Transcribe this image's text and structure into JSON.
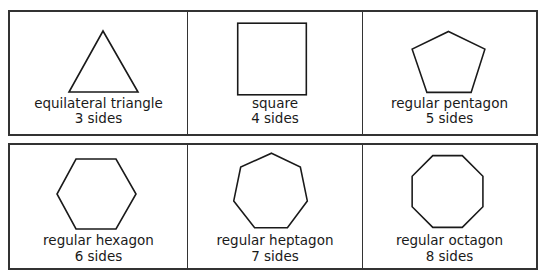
{
  "shapes": [
    {
      "name": "equilateral triangle",
      "sides_label": "3 sides",
      "sides": 3
    },
    {
      "name": "square",
      "sides_label": "4 sides",
      "sides": 4
    },
    {
      "name": "regular pentagon",
      "sides_label": "5 sides",
      "sides": 5
    },
    {
      "name": "regular hexagon",
      "sides_label": "6 sides",
      "sides": 6
    },
    {
      "name": "regular heptagon",
      "sides_label": "7 sides",
      "sides": 7
    },
    {
      "name": "regular octagon",
      "sides_label": "8 sides",
      "sides": 8
    }
  ],
  "colors": {
    "stroke": "#1a1a1a",
    "border": "#333333",
    "background": "#ffffff"
  }
}
